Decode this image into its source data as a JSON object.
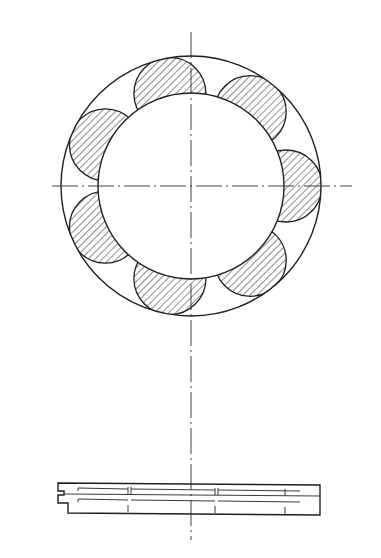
{
  "diagram": {
    "type": "technical-drawing",
    "front_view": {
      "center": [
        191,
        186
      ],
      "outer_ring_radius": 130,
      "inner_ring_radius": 93,
      "roller_count": 7,
      "roller_radius": 36,
      "roller_pitch_radius": 95,
      "roller_angles_deg": [
        0,
        51.43,
        102.86,
        154.29,
        205.71,
        257.14,
        308.57
      ],
      "roller_fill": "hatched",
      "colors": {
        "line": "#1e1e1e",
        "background": "#ffffff"
      }
    },
    "center_lines": {
      "vertical": {
        "x": 191,
        "y1": 32,
        "y2": 540
      },
      "horizontal": {
        "y": 186,
        "x1": 52,
        "x2": 352
      }
    },
    "side_view": {
      "x1": 58,
      "x2": 320,
      "y1": 483,
      "y2": 515,
      "strips": 2
    }
  }
}
